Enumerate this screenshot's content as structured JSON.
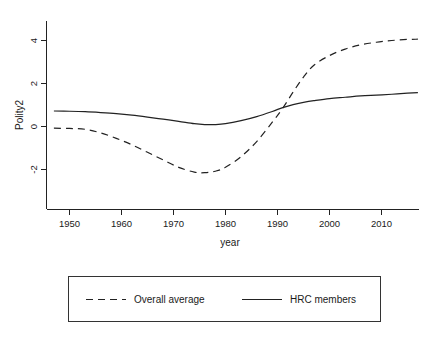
{
  "chart_data": {
    "type": "line",
    "title": "",
    "xlabel": "year",
    "ylabel": "Polity2",
    "xlim": [
      1946,
      2017
    ],
    "ylim": [
      -3.1,
      4.75
    ],
    "grid": false,
    "legend_position": "below-plot",
    "x_ticks": [
      1950,
      1960,
      1970,
      1980,
      1990,
      2000,
      2010
    ],
    "x_tick_labels": [
      "1950",
      "1960",
      "1970",
      "1980",
      "1990",
      "2000",
      "2010"
    ],
    "y_ticks": [
      -2,
      0,
      2,
      4
    ],
    "y_tick_labels": [
      "-2",
      "0",
      "2",
      "4"
    ],
    "series": [
      {
        "name": "Overall average",
        "style": "dashed",
        "color": "#222222",
        "x": [
          1947,
          1950,
          1953,
          1956,
          1959,
          1962,
          1965,
          1968,
          1971,
          1974,
          1976,
          1978,
          1980,
          1983,
          1986,
          1989,
          1991,
          1993,
          1995,
          1997,
          2000,
          2003,
          2006,
          2009,
          2012,
          2015,
          2017
        ],
        "values": [
          -0.08,
          -0.09,
          -0.13,
          -0.3,
          -0.55,
          -0.85,
          -1.2,
          -1.55,
          -1.9,
          -2.12,
          -2.15,
          -2.08,
          -1.9,
          -1.4,
          -0.7,
          0.2,
          0.85,
          1.6,
          2.3,
          2.85,
          3.3,
          3.6,
          3.8,
          3.92,
          4.0,
          4.05,
          4.06
        ]
      },
      {
        "name": "HRC members",
        "style": "solid",
        "color": "#222222",
        "x": [
          1947,
          1950,
          1953,
          1956,
          1959,
          1962,
          1965,
          1968,
          1971,
          1974,
          1976,
          1978,
          1980,
          1983,
          1986,
          1989,
          1991,
          1993,
          1995,
          1997,
          2000,
          2003,
          2006,
          2009,
          2012,
          2015,
          2017
        ],
        "values": [
          0.72,
          0.71,
          0.69,
          0.65,
          0.6,
          0.53,
          0.44,
          0.34,
          0.24,
          0.13,
          0.09,
          0.09,
          0.13,
          0.27,
          0.46,
          0.7,
          0.88,
          1.02,
          1.12,
          1.2,
          1.3,
          1.36,
          1.42,
          1.46,
          1.5,
          1.55,
          1.58
        ]
      }
    ]
  },
  "legend": {
    "entries": [
      {
        "label": "Overall average",
        "style": "dashed"
      },
      {
        "label": "HRC members",
        "style": "solid"
      }
    ]
  }
}
